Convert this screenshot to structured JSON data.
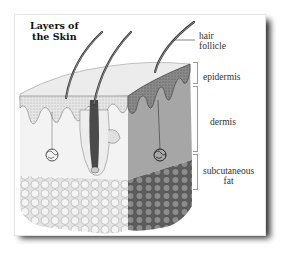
{
  "figure": {
    "title_lines": [
      "Layers of",
      "the Skin"
    ],
    "labels": {
      "hair_follicle": [
        "hair",
        "follicle"
      ],
      "epidermis": "epidermis",
      "dermis": "dermis",
      "subcutaneous_fat": [
        "subcutaneous",
        "fat"
      ]
    },
    "colors": {
      "background": "#ffffff",
      "card": "#ffffff",
      "shadow": "#111111",
      "epidermis_fill": "#d9d9d9",
      "dermis_fill": "#f2f2f2",
      "dermis_side": "#9e9e9e",
      "fat_fill": "#ececec",
      "fat_side": "#7a7a7a",
      "hair": "#3a3a3a",
      "label_text": "#333333",
      "bracket": "#9a9a9a"
    }
  }
}
